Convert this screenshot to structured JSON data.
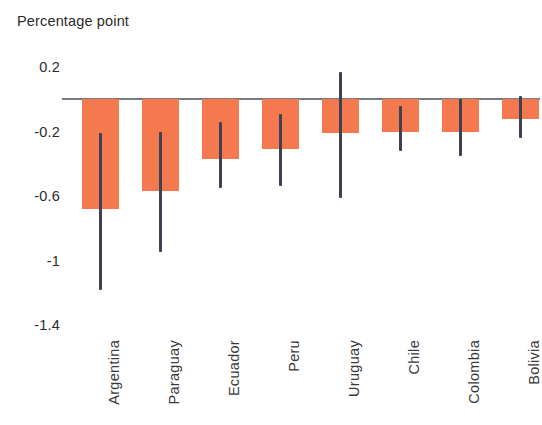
{
  "chart_data": {
    "type": "bar",
    "title": "",
    "ylabel": "Percentage point",
    "xlabel": "",
    "categories": [
      "Argentina",
      "Paraguay",
      "Ecuador",
      "Peru",
      "Uruguay",
      "Chile",
      "Colombia",
      "Bolivia"
    ],
    "values": [
      -0.68,
      -0.57,
      -0.37,
      -0.31,
      -0.21,
      -0.2,
      -0.2,
      -0.12
    ],
    "error_low": [
      -1.18,
      -0.95,
      -0.55,
      -0.54,
      -0.61,
      -0.32,
      -0.35,
      -0.24
    ],
    "error_high": [
      -0.21,
      -0.2,
      -0.14,
      -0.09,
      0.17,
      -0.04,
      0.0,
      0.02
    ],
    "ylim": [
      -1.4,
      0.2
    ],
    "yticks": [
      0.2,
      -0.2,
      -0.6,
      -1,
      -1.4
    ],
    "ytick_labels": [
      "0.2",
      "-0.2",
      "-0.6",
      "-1",
      "-1.4"
    ],
    "grid": false,
    "legend": "none",
    "bar_color": "#f4794f",
    "error_color": "#3c4250",
    "axis_color": "#6b6f78"
  },
  "axis": {
    "title": "Percentage point"
  }
}
